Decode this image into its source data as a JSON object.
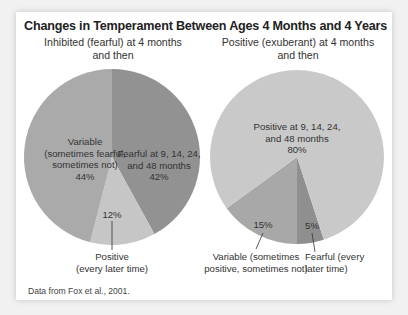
{
  "chart_data": [
    {
      "type": "pie",
      "title": "Changes in Temperament Between Ages 4 Months and 4 Years",
      "subtitle": "Inhibited (fearful) at 4 months and then",
      "slices": [
        {
          "label": "Fearful at 9, 14, 24, and 48 months",
          "value": 42,
          "color": "#929292"
        },
        {
          "label": "Positive (every later time)",
          "value": 12,
          "color": "#c6c6c6"
        },
        {
          "label": "Variable (sometimes fearful, sometimes not)",
          "value": 44,
          "color": "#aaaaaa"
        }
      ]
    },
    {
      "type": "pie",
      "title": "Changes in Temperament Between Ages 4 Months and 4 Years",
      "subtitle": "Positive (exuberant) at 4 months and then",
      "slices": [
        {
          "label": "Positive at 9, 14, 24, and 48 months",
          "value": 80,
          "color": "#c9c9c9"
        },
        {
          "label": "Variable (sometimes positive, sometimes not)",
          "value": 15,
          "color": "#a8a8a8"
        },
        {
          "label": "Fearful (every later time)",
          "value": 5,
          "color": "#8f8f8f"
        }
      ]
    }
  ],
  "figure": {
    "title": "Changes in Temperament Between Ages 4 Months and 4 Years",
    "source_note": "Data from Fox et al., 2001."
  },
  "left": {
    "subtitle_line1": "Inhibited (fearful) at 4 months",
    "subtitle_line2": "and then",
    "variable": {
      "l1": "Variable",
      "l2": "(sometimes fearful,",
      "l3": "sometimes not)",
      "pct": "44%"
    },
    "fearful": {
      "l1": "Fearful at 9, 14, 24,",
      "l2": "and 48 months",
      "pct": "42%"
    },
    "positive": {
      "pct": "12%",
      "l1": "Positive",
      "l2": "(every later time)"
    }
  },
  "right": {
    "subtitle_line1": "Positive (exuberant) at 4 months",
    "subtitle_line2": "and then",
    "positive": {
      "l1": "Positive at 9, 14, 24,",
      "l2": "and 48 months",
      "pct": "80%"
    },
    "variable": {
      "pct": "15%",
      "l1": "Variable (sometimes",
      "l2": "positive, sometimes not)"
    },
    "fearful": {
      "pct": "5%",
      "l1": "Fearful (every",
      "l2": "later time)"
    }
  }
}
